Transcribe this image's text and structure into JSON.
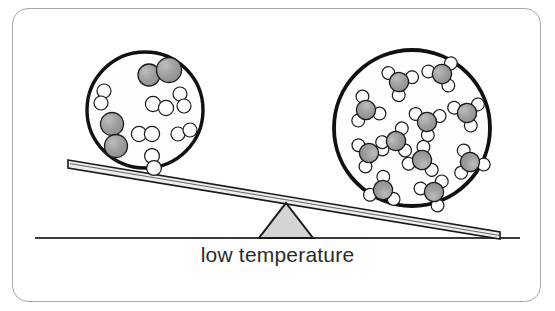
{
  "figure": {
    "caption": "low temperature",
    "frame": {
      "border_color": "#a8a8a8",
      "background": "#ffffff"
    },
    "colors": {
      "outline": "#111111",
      "circle_fill": "#fefefe",
      "atom_gray_fill": "#9d9d9d",
      "atom_white_fill": "#fbfbfb",
      "fulcrum_fill": "#d4d4d4",
      "beam_fill": "#e8e8e8",
      "ground": "#3a3a3a",
      "caption_color": "#2b2b2b"
    },
    "seesaw": {
      "label": "balance-beam-tilted-right-down",
      "ground_line": {
        "x1": 35,
        "y1": 238,
        "x2": 520,
        "y2": 238
      },
      "beam_top_left": {
        "x": 68,
        "y": 161
      },
      "beam_top_right": {
        "x": 500,
        "y": 234
      },
      "fulcrum": {
        "apex_x": 286,
        "apex_y": 206,
        "base_left_x": 260,
        "base_right_x": 312,
        "base_y": 238
      }
    },
    "left_circle": {
      "label": "low-temperature-diatomic-sample",
      "cx": 145,
      "cy": 110,
      "r": 58,
      "stroke_width": 3.4,
      "molecule_count": 9,
      "molecules": [
        {
          "type": "diatomic-gray",
          "atoms": [
            {
              "cx": 149,
              "cy": 75,
              "r": 11
            },
            {
              "cx": 168,
              "cy": 71,
              "r": 12
            }
          ]
        },
        {
          "type": "diatomic-gray",
          "atoms": [
            {
              "cx": 112,
              "cy": 125,
              "r": 11
            },
            {
              "cx": 116,
              "cy": 146,
              "r": 11
            }
          ]
        },
        {
          "type": "diatomic-white",
          "atoms": [
            {
              "cx": 103,
              "cy": 92,
              "r": 7
            },
            {
              "cx": 101,
              "cy": 103,
              "r": 7
            }
          ]
        },
        {
          "type": "diatomic-white",
          "atoms": [
            {
              "cx": 153,
              "cy": 104,
              "r": 7.5
            },
            {
              "cx": 165,
              "cy": 107,
              "r": 7.5
            }
          ]
        },
        {
          "type": "diatomic-white",
          "atoms": [
            {
              "cx": 179,
              "cy": 95,
              "r": 7
            },
            {
              "cx": 183,
              "cy": 106,
              "r": 7
            }
          ]
        },
        {
          "type": "diatomic-white",
          "atoms": [
            {
              "cx": 140,
              "cy": 135,
              "r": 7.5
            },
            {
              "cx": 152,
              "cy": 135,
              "r": 7.5
            }
          ]
        },
        {
          "type": "diatomic-white",
          "atoms": [
            {
              "cx": 179,
              "cy": 133,
              "r": 7
            },
            {
              "cx": 190,
              "cy": 130,
              "r": 7
            }
          ]
        },
        {
          "type": "diatomic-white",
          "atoms": [
            {
              "cx": 153,
              "cy": 157,
              "r": 7.5
            },
            {
              "cx": 155,
              "cy": 169,
              "r": 7.5
            }
          ]
        },
        {
          "type": "diatomic-white",
          "atoms": [
            {
              "cx": 125,
              "cy": 97,
              "r": 0
            },
            {
              "cx": 125,
              "cy": 97,
              "r": 0
            }
          ]
        }
      ]
    },
    "right_circle": {
      "label": "low-temperature-triatomic-product-sample",
      "cx": 412,
      "cy": 128,
      "r": 78,
      "stroke_width": 3.8,
      "molecule_count": 11,
      "molecules": [
        {
          "type": "nh3",
          "cx": 399,
          "cy": 80,
          "rot": 15
        },
        {
          "type": "nh3",
          "cx": 440,
          "cy": 72,
          "rot": -25
        },
        {
          "type": "nh3",
          "cx": 365,
          "cy": 110,
          "rot": 50
        },
        {
          "type": "nh3",
          "cx": 426,
          "cy": 120,
          "rot": 5
        },
        {
          "type": "nh3",
          "cx": 466,
          "cy": 112,
          "rot": -10
        },
        {
          "type": "nh3",
          "cx": 368,
          "cy": 152,
          "rot": 140
        },
        {
          "type": "nh3",
          "cx": 422,
          "cy": 158,
          "rot": 200
        },
        {
          "type": "nh3",
          "cx": 470,
          "cy": 160,
          "rot": 160
        },
        {
          "type": "nh3",
          "cx": 381,
          "cy": 190,
          "rot": 195
        },
        {
          "type": "nh3",
          "cx": 433,
          "cy": 193,
          "rot": 230
        },
        {
          "type": "nh3",
          "cx": 409,
          "cy": 52,
          "rot": 0
        }
      ]
    }
  }
}
